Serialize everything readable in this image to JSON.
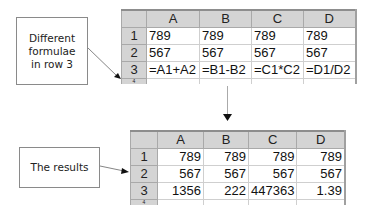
{
  "callouts": {
    "formulae": {
      "lines": [
        "Different",
        "formulae",
        "in row 3"
      ]
    },
    "results": {
      "text": "The results"
    }
  },
  "top_sheet": {
    "columns": [
      "A",
      "B",
      "C",
      "D"
    ],
    "rows": [
      {
        "num": "1",
        "cells": [
          "789",
          "789",
          "789",
          "789"
        ]
      },
      {
        "num": "2",
        "cells": [
          "567",
          "567",
          "567",
          "567"
        ]
      },
      {
        "num": "3",
        "cells": [
          "=A1+A2",
          "=B1-B2",
          "=C1*C2",
          "=D1/D2"
        ]
      }
    ],
    "partial_row_num": "4"
  },
  "bottom_sheet": {
    "columns": [
      "A",
      "B",
      "C",
      "D"
    ],
    "rows": [
      {
        "num": "1",
        "cells": [
          "789",
          "789",
          "789",
          "789"
        ]
      },
      {
        "num": "2",
        "cells": [
          "567",
          "567",
          "567",
          "567"
        ]
      },
      {
        "num": "3",
        "cells": [
          "1356",
          "222",
          "447363",
          "1.39"
        ]
      }
    ],
    "partial_row_num": "4"
  },
  "colors": {
    "header_bg": "#d4d4d4",
    "grid_line": "#cfcfcf",
    "callout_border": "#8a8a8a",
    "arrow": "#333333"
  }
}
